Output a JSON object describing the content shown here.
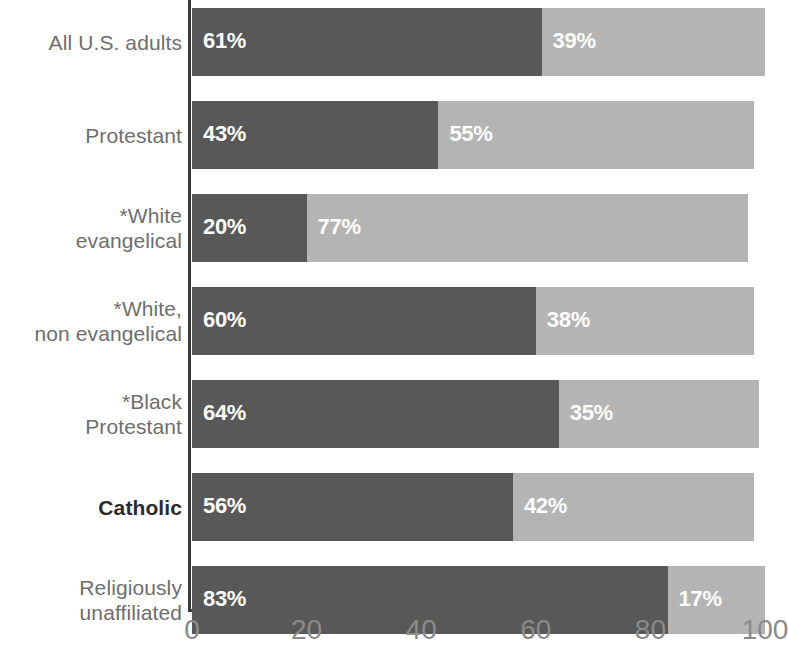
{
  "chart_data": {
    "type": "bar",
    "orientation": "horizontal",
    "stacked": true,
    "title": "",
    "subtitle": "",
    "xlabel": "",
    "ylabel": "",
    "xlim": [
      0,
      100
    ],
    "ylim": null,
    "grid": false,
    "legend": null,
    "xticks": [
      "0",
      "20",
      "40",
      "60",
      "80",
      "100"
    ],
    "xtick_values": [
      0,
      20,
      40,
      60,
      80,
      100
    ],
    "categories": [
      "All U.S. adults",
      "Protestant",
      "*White\nevangelical",
      "*White,\nnon evangelical",
      "*Black\nProtestant",
      "Catholic",
      "Religiously\nunaffiliated"
    ],
    "highlight_category": "Catholic",
    "series": [
      {
        "name": "first",
        "color": "#585858",
        "values": [
          61,
          43,
          20,
          60,
          64,
          56,
          83
        ],
        "labels": [
          "61%",
          "43%",
          "20%",
          "60%",
          "64%",
          "56%",
          "83%"
        ]
      },
      {
        "name": "second",
        "color": "#b4b4b4",
        "values": [
          39,
          55,
          77,
          38,
          35,
          42,
          17
        ],
        "labels": [
          "39%",
          "55%",
          "77%",
          "38%",
          "35%",
          "42%",
          "17%"
        ]
      }
    ],
    "rows": [
      {
        "category": "All U.S. adults",
        "a": 61,
        "a_label": "61%",
        "b": 39,
        "b_label": "39%"
      },
      {
        "category": "Protestant",
        "a": 43,
        "a_label": "43%",
        "b": 55,
        "b_label": "55%"
      },
      {
        "category": "*White\nevangelical",
        "a": 20,
        "a_label": "20%",
        "b": 77,
        "b_label": "77%"
      },
      {
        "category": "*White,\nnon evangelical",
        "a": 60,
        "a_label": "60%",
        "b": 38,
        "b_label": "38%"
      },
      {
        "category": "*Black\nProtestant",
        "a": 64,
        "a_label": "64%",
        "b": 35,
        "b_label": "35%"
      },
      {
        "category": "Catholic",
        "a": 56,
        "a_label": "56%",
        "b": 42,
        "b_label": "42%"
      },
      {
        "category": "Religiously\nunaffiliated",
        "a": 83,
        "a_label": "83%",
        "b": 17,
        "b_label": "17%"
      }
    ],
    "colors": {
      "series_a": "#585858",
      "series_b": "#b4b4b4",
      "axis": "#3a3a3a",
      "tick_text": "#8a8a8a",
      "category_text": "#6e6e6e",
      "category_text_highlight": "#2b2b2b",
      "value_text": "#ffffff",
      "background": "#ffffff"
    }
  }
}
